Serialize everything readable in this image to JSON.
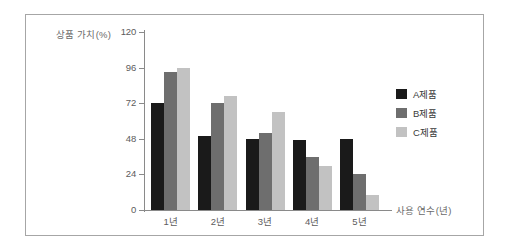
{
  "chart_data": {
    "type": "bar",
    "title": "",
    "xlabel": "사용 연수(년)",
    "ylabel": "상품 가치(%)",
    "categories": [
      "1년",
      "2년",
      "3년",
      "4년",
      "5년"
    ],
    "yticks": [
      0,
      24,
      48,
      72,
      96,
      120
    ],
    "ytick_labels": [
      "0",
      "24",
      "48",
      "72",
      "96",
      "120"
    ],
    "ylim": [
      0,
      120
    ],
    "grid": false,
    "legend_position": "right",
    "series": [
      {
        "name": "A제품",
        "color": "#1a1a1a",
        "values": [
          72,
          50,
          48,
          47,
          48
        ]
      },
      {
        "name": "B제품",
        "color": "#6e6e6e",
        "values": [
          93,
          72,
          52,
          36,
          24
        ]
      },
      {
        "name": "C제품",
        "color": "#c2c2c2",
        "values": [
          96,
          77,
          66,
          30,
          10
        ]
      }
    ]
  },
  "legend": {
    "items": [
      {
        "label": "A제품",
        "color": "#1a1a1a"
      },
      {
        "label": "B제품",
        "color": "#6e6e6e"
      },
      {
        "label": "C제품",
        "color": "#c2c2c2"
      }
    ]
  },
  "colors": {
    "frame": "#a6a6a6",
    "axis": "#8a8a8a",
    "tick_text": "#5c5c5c",
    "axis_title_text": "#6a6a6a",
    "background": "#ffffff"
  }
}
